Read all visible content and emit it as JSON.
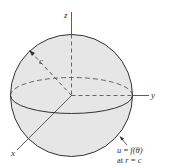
{
  "diagram": {
    "colors": {
      "sphere_fill": "#e6e6e6",
      "stroke": "#333333",
      "background": "#ffffff"
    },
    "axes": {
      "x": "x",
      "y": "y",
      "z": "z"
    },
    "radius_label": "c",
    "boundary_condition": {
      "line1_a": "u",
      "line1_b": " = ",
      "line1_c": "f",
      "line1_d": "(θ)",
      "line2_a": "at ",
      "line2_b": "r",
      "line2_c": " = ",
      "line2_d": "c"
    }
  }
}
